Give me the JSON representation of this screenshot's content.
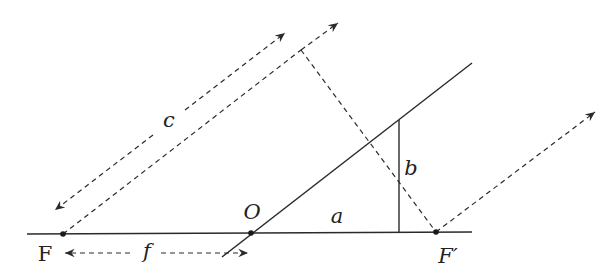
{
  "diagram": {
    "type": "geometry-optics",
    "labels": {
      "c": "c",
      "O": "O",
      "a": "a",
      "b": "b",
      "F": "F",
      "f": "f",
      "F_prime": "F′"
    },
    "points": {
      "F": [
        63,
        234
      ],
      "O": [
        251,
        233
      ],
      "F_prime": [
        436,
        232
      ]
    },
    "stroke_color": "#2a2a2a",
    "background": "#ffffff"
  }
}
